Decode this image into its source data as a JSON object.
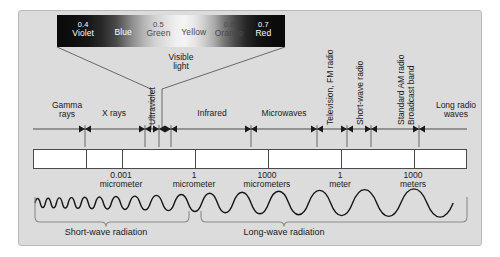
{
  "figure": {
    "background_color": "#dcdcdc",
    "frame_color": "#b9b9b9"
  },
  "visible_light": {
    "callout_label": "Visible\nlight",
    "callout_line1": "Visible",
    "callout_line2": "light",
    "swatches": [
      {
        "value": "0.4",
        "name": "Violet",
        "tone": "light",
        "left_pct": 4,
        "width_pct": 17
      },
      {
        "value": "",
        "name": "Blue",
        "tone": "light",
        "left_pct": 21,
        "width_pct": 16
      },
      {
        "value": "0.5",
        "name": "Green",
        "tone": "dark",
        "left_pct": 37,
        "width_pct": 16
      },
      {
        "value": "",
        "name": "Yellow",
        "tone": "dark",
        "left_pct": 53,
        "width_pct": 15
      },
      {
        "value": "0.6",
        "name": "Orange",
        "tone": "dark",
        "left_pct": 68,
        "width_pct": 16
      },
      {
        "value": "0.7",
        "name": "Red",
        "tone": "light",
        "left_pct": 84,
        "width_pct": 14
      }
    ],
    "unit_note": "micrometers"
  },
  "bands": [
    {
      "label": "Gamma rays",
      "line1": "Gamma",
      "line2": "rays",
      "orientation": "horizontal",
      "center_px": 48,
      "width_px": 58
    },
    {
      "label": "X rays",
      "line1": "X rays",
      "line2": "",
      "orientation": "horizontal",
      "center_px": 95,
      "width_px": 52
    },
    {
      "label": "Ultraviolet",
      "line1": "Ultraviolet",
      "line2": "",
      "orientation": "vertical",
      "center_px": 133,
      "width_px": 12
    },
    {
      "label": "Infrared",
      "line1": "Infrared",
      "line2": "",
      "orientation": "horizontal",
      "center_px": 202,
      "width_px": 56
    },
    {
      "label": "Microwaves",
      "line1": "Microwaves",
      "line2": "",
      "orientation": "horizontal",
      "center_px": 264,
      "width_px": 66
    },
    {
      "label": "Television, FM radio",
      "line1": "Television, FM radio",
      "line2": "",
      "orientation": "vertical",
      "center_px": 312,
      "width_px": 12
    },
    {
      "label": "Short-wave radio",
      "line1": "Short-wave radio",
      "line2": "",
      "orientation": "vertical",
      "center_px": 341,
      "width_px": 12
    },
    {
      "label": "Standard AM radio Broadcast band",
      "line1": "Standard AM radio",
      "line2": "Broadcast band",
      "orientation": "vertical",
      "center_px": 389,
      "width_px": 22
    },
    {
      "label": "Long radio waves",
      "line1": "Long radio",
      "line2": "waves",
      "orientation": "horizontal",
      "center_px": 440,
      "width_px": 56
    }
  ],
  "scale": {
    "ticks": [
      {
        "value": "0.001",
        "unit": "micrometer",
        "x_px": 102
      },
      {
        "value": "1",
        "unit": "micrometer",
        "x_px": 175
      },
      {
        "value": "1000",
        "unit": "micrometers",
        "x_px": 248
      },
      {
        "value": "1",
        "unit": "meter",
        "x_px": 321
      },
      {
        "value": "1000",
        "unit": "meters",
        "x_px": 394
      }
    ],
    "divider_positions_px": [
      66,
      102,
      175,
      248,
      321,
      394
    ]
  },
  "radiation": {
    "short_wave_label": "Short-wave radiation",
    "long_wave_label": "Long-wave radiation",
    "split_x_px": 176
  },
  "colors": {
    "background": "#dcdcdc",
    "text": "#1a1a1a",
    "line": "#4a4a4a",
    "wave": "#141414"
  }
}
